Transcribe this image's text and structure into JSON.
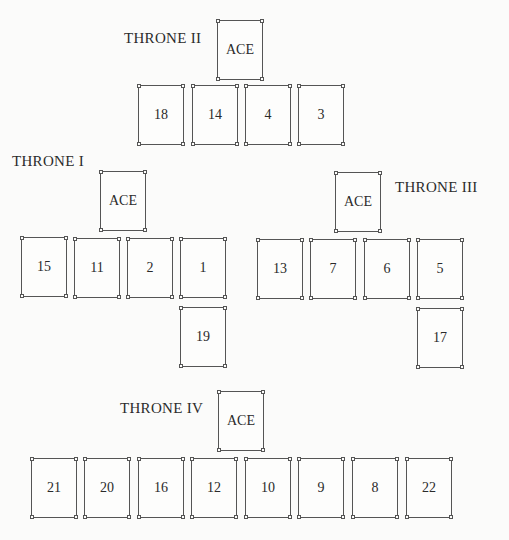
{
  "thrones": [
    {
      "id": "throne-ii",
      "label": "THRONE II",
      "label_pos": [
        124,
        30
      ],
      "ace": {
        "text": "ACE",
        "pos": [
          217,
          20
        ]
      },
      "cards": [
        {
          "text": "18",
          "pos": [
            138,
            85
          ]
        },
        {
          "text": "14",
          "pos": [
            192,
            85
          ]
        },
        {
          "text": "4",
          "pos": [
            245,
            85
          ]
        },
        {
          "text": "3",
          "pos": [
            298,
            85
          ]
        }
      ]
    },
    {
      "id": "throne-i",
      "label": "THRONE I",
      "label_pos": [
        12,
        153
      ],
      "ace": {
        "text": "ACE",
        "pos": [
          100,
          171
        ]
      },
      "cards": [
        {
          "text": "15",
          "pos": [
            21,
            237
          ]
        },
        {
          "text": "11",
          "pos": [
            74,
            238
          ]
        },
        {
          "text": "2",
          "pos": [
            127,
            238
          ]
        },
        {
          "text": "1",
          "pos": [
            180,
            238
          ]
        },
        {
          "text": "19",
          "pos": [
            180,
            307
          ]
        }
      ]
    },
    {
      "id": "throne-iii",
      "label": "THRONE III",
      "label_pos": [
        395,
        179
      ],
      "ace": {
        "text": "ACE",
        "pos": [
          335,
          172
        ]
      },
      "cards": [
        {
          "text": "13",
          "pos": [
            257,
            239
          ]
        },
        {
          "text": "7",
          "pos": [
            310,
            239
          ]
        },
        {
          "text": "6",
          "pos": [
            364,
            239
          ]
        },
        {
          "text": "5",
          "pos": [
            417,
            239
          ]
        },
        {
          "text": "17",
          "pos": [
            417,
            308
          ]
        }
      ]
    },
    {
      "id": "throne-iv",
      "label": "THRONE IV",
      "label_pos": [
        120,
        400
      ],
      "ace": {
        "text": "ACE",
        "pos": [
          218,
          391
        ]
      },
      "cards": [
        {
          "text": "21",
          "pos": [
            31,
            458
          ]
        },
        {
          "text": "20",
          "pos": [
            84,
            458
          ]
        },
        {
          "text": "16",
          "pos": [
            138,
            458
          ]
        },
        {
          "text": "12",
          "pos": [
            191,
            458
          ]
        },
        {
          "text": "10",
          "pos": [
            245,
            458
          ]
        },
        {
          "text": "9",
          "pos": [
            298,
            458
          ]
        },
        {
          "text": "8",
          "pos": [
            352,
            458
          ]
        },
        {
          "text": "22",
          "pos": [
            406,
            458
          ]
        }
      ]
    }
  ]
}
